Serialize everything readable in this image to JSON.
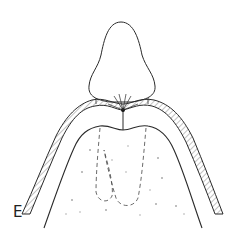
{
  "figure": {
    "panel_label": "E",
    "colors": {
      "line": "#2a2a2a",
      "hatch": "#555555",
      "speckle": "#999999",
      "background": "#ffffff"
    },
    "parts": [
      {
        "name": "crown",
        "description": "rounded conical cap at top"
      },
      {
        "name": "junction-point",
        "description": "dark contact point with radiating lines"
      },
      {
        "name": "outer-layer",
        "description": "hatched band arching over the ridge"
      },
      {
        "name": "inner-ridge",
        "description": "solid outline of underlying ridge"
      },
      {
        "name": "dashed-roots",
        "description": "two dashed U-shaped outlines inside the ridge"
      },
      {
        "name": "speckled-fill",
        "description": "light stippled texture inside ridge"
      }
    ]
  }
}
